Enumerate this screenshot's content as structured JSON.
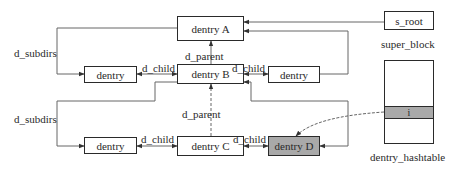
{
  "diagram": {
    "nodes": {
      "dentry_a": {
        "label": "dentry A"
      },
      "dentry_b": {
        "label": "dentry B"
      },
      "dentry_c": {
        "label": "dentry C"
      },
      "dentry_d": {
        "label": "dentry D",
        "fill": "#a9a9a9"
      },
      "sibling_b_left": {
        "label": "dentry"
      },
      "sibling_b_right": {
        "label": "dentry"
      },
      "sibling_c_left": {
        "label": "dentry"
      },
      "s_root": {
        "label": "s_root"
      }
    },
    "captions": {
      "super_block": "super_block",
      "dentry_hashtable": "dentry_hashtable"
    },
    "hashtable": {
      "highlighted_slot": "i",
      "slot_fill": "#a9a9a9"
    },
    "edge_labels": {
      "d_subdirs_top": "d_subdirs",
      "d_subdirs_bottom": "d_subdirs",
      "d_parent_b_to_a": "d_parent",
      "d_parent_c_to_b": "d_parent",
      "d_child_b_left": "d_child",
      "d_child_b_right": "d_child",
      "d_child_c_left": "d_child",
      "d_child_c_right": "d_child"
    },
    "colors": {
      "line": "#555555",
      "box_border": "#2a2a2a",
      "shaded": "#a9a9a9"
    }
  }
}
